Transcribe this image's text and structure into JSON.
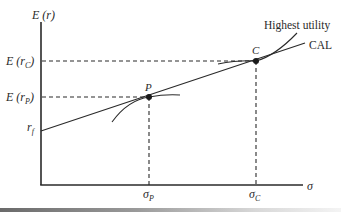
{
  "diagram": {
    "type": "capital-allocation-line",
    "y_axis_label": "E (r)",
    "x_axis_label": "σ",
    "y_ticks": {
      "e_rc": "E (r",
      "e_rc_sub": "C",
      "e_rc_close": ")",
      "e_rp": "E (r",
      "e_rp_sub": "P",
      "e_rp_close": ")",
      "rf": "r",
      "rf_sub": "f"
    },
    "x_ticks": {
      "sigma_p": "σ",
      "sigma_p_sub": "P",
      "sigma_c": "σ",
      "sigma_c_sub": "C"
    },
    "points": {
      "p_label": "P",
      "c_label": "C"
    },
    "curve_labels": {
      "highest_utility": "Highest utility",
      "cal": "CAL"
    },
    "colors": {
      "ink": "#2a2a2a",
      "background": "#ffffff"
    }
  }
}
